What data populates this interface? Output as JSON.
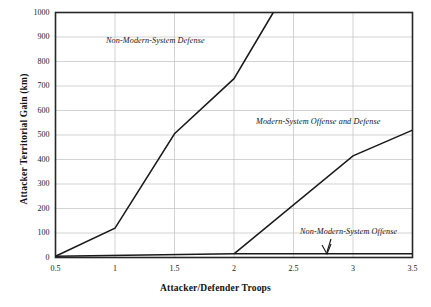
{
  "chart_data": {
    "type": "line",
    "title": "",
    "xlabel": "Attacker/Defender Troops",
    "ylabel": "Attacker Territorial Gain (km)",
    "xlim": [
      0.5,
      3.5
    ],
    "ylim": [
      0,
      1000
    ],
    "xticks": [
      "0.5",
      "1",
      "1.5",
      "2",
      "2.5",
      "3",
      "3.5"
    ],
    "xtick_values": [
      0.5,
      1,
      1.5,
      2,
      2.5,
      3,
      3.5
    ],
    "yticks": [
      "0",
      "100",
      "200",
      "300",
      "400",
      "500",
      "600",
      "700",
      "800",
      "900",
      "1000"
    ],
    "ytick_values": [
      0,
      100,
      200,
      300,
      400,
      500,
      600,
      700,
      800,
      900,
      1000
    ],
    "grid": true,
    "grid_color": "#c8c8c8",
    "legend": "none",
    "line_color": "#1a1a1a",
    "series": [
      {
        "name": "Non-Modern-System Defense",
        "x": [
          0.5,
          1.0,
          1.5,
          2.0,
          2.33
        ],
        "values": [
          5,
          120,
          505,
          730,
          1000
        ]
      },
      {
        "name": "Modern-System Offense and Defense",
        "x": [
          2.0,
          3.0,
          3.5
        ],
        "values": [
          15,
          415,
          520
        ]
      },
      {
        "name": "Non-Modern-System Offense",
        "x": [
          0.5,
          2.0,
          3.5
        ],
        "values": [
          5,
          15,
          15
        ]
      }
    ],
    "annotations": [
      {
        "id": "non-modern-system-defense",
        "text": "Non-Modern-System Defense",
        "x": 1.38,
        "y": 880
      },
      {
        "id": "modern-system-offense-and-defense",
        "text": "Modern-System Offense and Defense",
        "x": 2.64,
        "y": 548
      },
      {
        "id": "non-modern-system-offense",
        "text": "Non-Modern-System Offense",
        "x": 3.02,
        "y": 100,
        "arrow": "down"
      }
    ]
  }
}
